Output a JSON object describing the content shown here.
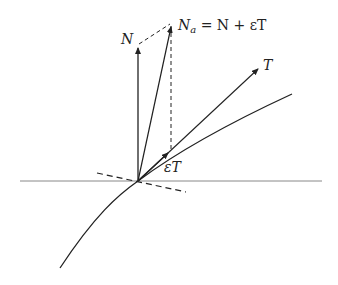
{
  "diagram": {
    "labels": {
      "N": "N",
      "Na_main": "N",
      "Na_sub": "a",
      "Na_rest": " = N + εT",
      "T": "T",
      "epsT": "εT"
    },
    "colors": {
      "stroke": "#222222",
      "axis": "#777777"
    }
  }
}
